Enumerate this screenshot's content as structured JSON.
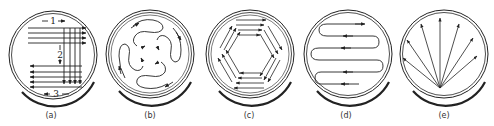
{
  "figure": {
    "panels": [
      {
        "id": "a",
        "caption": "(a)",
        "pattern": "raster-grid",
        "labels": [
          "1",
          "2",
          "3"
        ]
      },
      {
        "id": "b",
        "caption": "(b)",
        "pattern": "serpentine-radial"
      },
      {
        "id": "c",
        "caption": "(c)",
        "pattern": "hexagonal-parallel-strokes"
      },
      {
        "id": "d",
        "caption": "(d)",
        "pattern": "zigzag-boustrophedon"
      },
      {
        "id": "e",
        "caption": "(e)",
        "pattern": "fan-radiating"
      }
    ],
    "stroke_color": "#222222",
    "background": "#ffffff"
  }
}
